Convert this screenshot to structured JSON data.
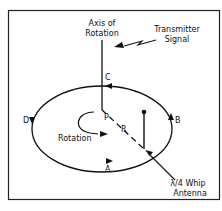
{
  "diagram": {
    "labels": {
      "axis_line1": "Axis of",
      "axis_line2": "Rotation",
      "signal_line1": "Transmitter",
      "signal_line2": "Signal",
      "point_a": "A",
      "point_b": "B",
      "point_c": "C",
      "point_d": "D",
      "center_p": "P",
      "radius_r": "R",
      "rotation": "Rotation",
      "antenna_line1": "λ/4 Whip",
      "antenna_line2": "Antenna"
    },
    "colors": {
      "stroke": "#111111",
      "background": "#ffffff",
      "frame": "#222222"
    }
  }
}
